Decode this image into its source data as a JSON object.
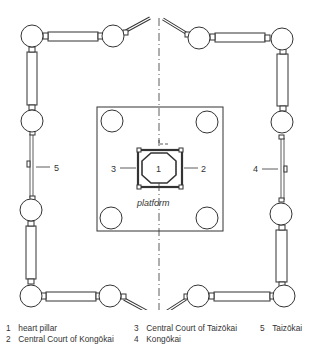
{
  "diagram": {
    "labels": {
      "heart_pillar": "1",
      "kongokai_court": "2",
      "taizokai_court": "3",
      "kongokai": "4",
      "taizokai": "5",
      "platform": "platform"
    }
  },
  "legend": {
    "items": [
      {
        "num": "1",
        "text": "heart pillar"
      },
      {
        "num": "2",
        "text": "Central Court of Kongōkai"
      },
      {
        "num": "3",
        "text": "Central Court of Taizōkai"
      },
      {
        "num": "4",
        "text": "Kongōkai"
      },
      {
        "num": "5",
        "text": "Taizōkai"
      }
    ]
  },
  "colors": {
    "line": "#333333",
    "background": "#ffffff"
  }
}
